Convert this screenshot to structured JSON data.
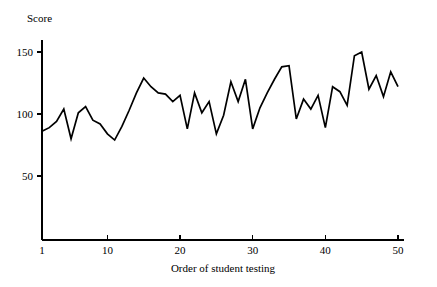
{
  "chart_data": {
    "type": "line",
    "title": "",
    "xlabel": "Order of student testing",
    "ylabel": "Score",
    "x": [
      1,
      2,
      3,
      4,
      5,
      6,
      7,
      8,
      9,
      10,
      11,
      12,
      13,
      14,
      15,
      16,
      17,
      18,
      19,
      20,
      21,
      22,
      23,
      24,
      25,
      26,
      27,
      28,
      29,
      30,
      31,
      32,
      33,
      34,
      35,
      36,
      37,
      38,
      39,
      40,
      41,
      42,
      43,
      44,
      45,
      46,
      47,
      48,
      49,
      50
    ],
    "values": [
      86,
      89,
      94,
      104,
      80,
      101,
      106,
      95,
      92,
      84,
      79,
      90,
      103,
      117,
      129,
      122,
      117,
      116,
      110,
      115,
      88,
      117,
      101,
      110,
      84,
      99,
      126,
      110,
      128,
      88,
      105,
      117,
      128,
      138,
      139,
      96,
      112,
      104,
      115,
      89,
      122,
      118,
      107,
      147,
      150,
      120,
      131,
      114,
      134,
      122
    ],
    "series": [
      {
        "name": "Score",
        "values": [
          86,
          89,
          94,
          104,
          80,
          101,
          106,
          95,
          92,
          84,
          79,
          90,
          103,
          117,
          129,
          122,
          117,
          116,
          110,
          115,
          88,
          117,
          101,
          110,
          84,
          99,
          126,
          110,
          128,
          88,
          105,
          117,
          128,
          138,
          139,
          96,
          112,
          104,
          115,
          89,
          122,
          118,
          107,
          147,
          150,
          120,
          131,
          114,
          134,
          122
        ]
      }
    ],
    "xlim": [
      1,
      50
    ],
    "ylim": [
      0,
      160
    ],
    "xticks": [
      1,
      10,
      20,
      30,
      40,
      50
    ],
    "xtick_labels": [
      "1",
      "10",
      "20",
      "30",
      "40",
      "50"
    ],
    "yticks": [
      50,
      100,
      150
    ],
    "ytick_labels": [
      "50",
      "100",
      "150"
    ],
    "grid": false,
    "legend": null,
    "line_color": "#000000",
    "background_color": "#ffffff"
  },
  "axes": {
    "y_label": "Score",
    "x_label": "Order of student testing"
  }
}
